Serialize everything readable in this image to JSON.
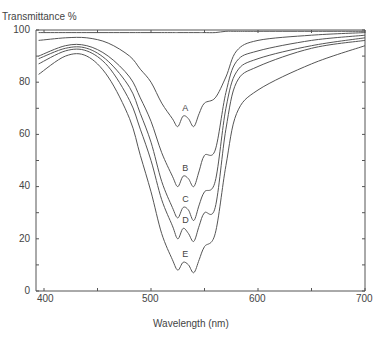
{
  "chart_data": {
    "type": "line",
    "title": "",
    "xlabel": "Wavelength  (nm)",
    "ylabel": "Transmittance  %",
    "xlim": [
      395,
      705
    ],
    "ylim": [
      0,
      100
    ],
    "x_ticks": [
      400,
      500,
      600,
      700
    ],
    "y_ticks": [
      0,
      20,
      40,
      60,
      80,
      100
    ],
    "grid": false,
    "legend": "inline labels A–E at trough",
    "x": [
      395,
      420,
      440,
      460,
      480,
      490,
      500,
      510,
      520,
      525,
      530,
      535,
      540,
      545,
      550,
      560,
      570,
      580,
      600,
      650,
      700
    ],
    "series": [
      {
        "name": "top (reference)",
        "values": [
          99,
          99,
          99,
          99,
          99,
          99,
          99,
          99,
          99,
          99,
          99,
          99,
          99,
          99,
          99,
          99,
          99.5,
          99.5,
          99.5,
          99.5,
          99.5
        ]
      },
      {
        "name": "A",
        "values": [
          96,
          97,
          97,
          95,
          90,
          85,
          80,
          72,
          66,
          63,
          67,
          66,
          63,
          68,
          72,
          74,
          82,
          92,
          96,
          98,
          99
        ]
      },
      {
        "name": "B",
        "values": [
          90,
          94,
          94,
          90,
          82,
          74,
          65,
          53,
          44,
          40,
          44,
          43,
          40,
          46,
          52,
          54,
          76,
          88,
          92,
          96,
          98
        ]
      },
      {
        "name": "C",
        "values": [
          89,
          93,
          93,
          88,
          78,
          68,
          57,
          42,
          32,
          28,
          32,
          31,
          27,
          33,
          38,
          42,
          70,
          84,
          89,
          94,
          97
        ]
      },
      {
        "name": "D",
        "values": [
          87,
          92,
          92,
          86,
          73,
          62,
          50,
          35,
          25,
          20,
          24,
          22,
          19,
          25,
          30,
          32,
          62,
          80,
          86,
          93,
          96
        ]
      },
      {
        "name": "E",
        "values": [
          83,
          90,
          90,
          82,
          66,
          52,
          38,
          22,
          12,
          8,
          11,
          10,
          7,
          12,
          17,
          22,
          48,
          68,
          77,
          87,
          94
        ]
      }
    ],
    "labels": {
      "A": "A",
      "B": "B",
      "C": "C",
      "D": "D",
      "E": "E"
    }
  },
  "axis": {
    "y_title": "Transmittance  %",
    "x_title": "Wavelength  (nm)",
    "y_tick_labels": [
      "100",
      "80",
      "60",
      "40",
      "20",
      "0"
    ],
    "x_tick_labels": [
      "400",
      "500",
      "600",
      "700"
    ]
  },
  "colors": {
    "line": "#555555",
    "axis": "#555555"
  }
}
